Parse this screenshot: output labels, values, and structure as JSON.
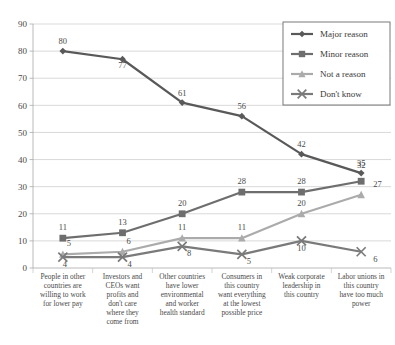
{
  "chart_data": {
    "type": "line",
    "title": "",
    "subtitle": "",
    "xlabel": "",
    "ylabel": "",
    "ylim": [
      0,
      90
    ],
    "ytick_step": 10,
    "yticks": [
      "0",
      "10",
      "20",
      "30",
      "40",
      "50",
      "60",
      "70",
      "80",
      "90"
    ],
    "grid": true,
    "legend_position": "top-right",
    "categories": [
      "People in other countries are willing to work for lower pay",
      "Investors and CEOs want profits and don't care where they come from",
      "Other countries have lower environmental and worker health standard",
      "Consumers in this country want everything at the lowest possible price",
      "Weak corporate leadership in this country",
      "Labor unions in this country have too much power"
    ],
    "series": [
      {
        "name": "Major reason",
        "marker": "diamond",
        "color": "#595959",
        "values": [
          80,
          77,
          61,
          56,
          42,
          35
        ]
      },
      {
        "name": "Minor reason",
        "marker": "square",
        "color": "#6e6e6e",
        "values": [
          11,
          13,
          20,
          28,
          28,
          32
        ]
      },
      {
        "name": "Not a reason",
        "marker": "triangle",
        "color": "#ababab",
        "values": [
          5,
          6,
          11,
          11,
          20,
          27
        ]
      },
      {
        "name": "Don't know",
        "marker": "x",
        "color": "#7a7a7a",
        "values": [
          4,
          4,
          8,
          5,
          10,
          6
        ]
      }
    ]
  },
  "legend": {
    "items": [
      {
        "label": "Major reason"
      },
      {
        "label": "Minor reason"
      },
      {
        "label": "Not a reason"
      },
      {
        "label": "Don't know"
      }
    ]
  },
  "colors": {
    "major": "#595959",
    "minor": "#6e6e6e",
    "not": "#ababab",
    "dont": "#7a7a7a",
    "grid": "#c9c9c9",
    "axis": "#a8a8a8",
    "text": "#4a4a4a"
  }
}
